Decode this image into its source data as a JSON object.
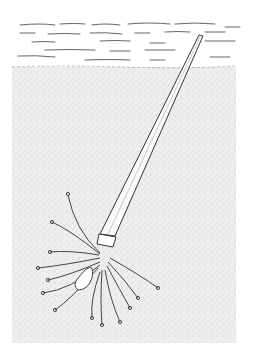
{
  "figure": {
    "colors": {
      "background": "#ffffff",
      "ink": "#333333",
      "sediment": "#e9e9e9"
    }
  }
}
